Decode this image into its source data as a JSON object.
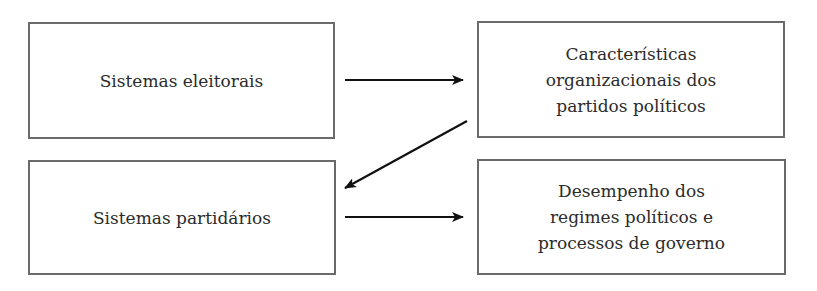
{
  "diagram": {
    "nodes": [
      {
        "id": "sistemas-eleitorais",
        "label": "Sistemas eleitorais"
      },
      {
        "id": "caracteristicas-organizacionais",
        "label": "Características\norganizacionais dos\npartidos políticos"
      },
      {
        "id": "sistemas-partidarios",
        "label": "Sistemas partidários"
      },
      {
        "id": "desempenho-regimes",
        "label": "Desempenho dos\nregimes políticos e\nprocessos de governo"
      }
    ],
    "edges": [
      {
        "from": "sistemas-eleitorais",
        "to": "caracteristicas-organizacionais"
      },
      {
        "from": "caracteristicas-organizacionais",
        "to": "sistemas-partidarios"
      },
      {
        "from": "sistemas-partidarios",
        "to": "desempenho-regimes"
      }
    ],
    "colors": {
      "border": "#6a6a6a",
      "arrow": "#111111",
      "text": "#2b2b2b"
    }
  }
}
